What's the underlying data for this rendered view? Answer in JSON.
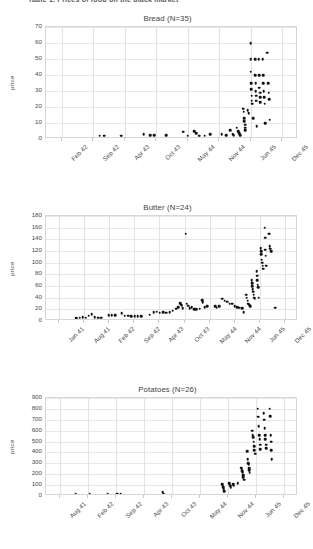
{
  "document": {
    "header_text": "Table 1. Prices of food on the black market"
  },
  "charts": [
    {
      "title": "Bread (N=35)",
      "ylabel": "price",
      "chart_index": 0
    },
    {
      "title": "Butter (N=24)",
      "ylabel": "price",
      "chart_index": 1
    },
    {
      "title": "Potatoes (N=26)",
      "ylabel": "price",
      "chart_index": 2
    }
  ],
  "chart_data": [
    {
      "type": "scatter",
      "title": "Bread (N=35)",
      "xlabel": "",
      "ylabel": "price",
      "ylim": [
        0,
        70
      ],
      "yticks": [
        0,
        10,
        20,
        30,
        40,
        50,
        60,
        70
      ],
      "xticks": [
        "Feb 42",
        "Sep 42",
        "Apr 43",
        "Oct 43",
        "May 44",
        "Nov 44",
        "Jun 45",
        "Dec 45"
      ],
      "xlim_months": [
        0,
        47
      ],
      "grid": true,
      "legend": "none",
      "note": "x positions are months measured from Nov 41 (tick 0 = Feb 42 at month 3)",
      "points": [
        {
          "x": 10.0,
          "y": 2.0
        },
        {
          "x": 10.8,
          "y": 2.0
        },
        {
          "x": 14.0,
          "y": 2.0
        },
        {
          "x": 18.2,
          "y": 3.0
        },
        {
          "x": 19.4,
          "y": 2.5
        },
        {
          "x": 20.2,
          "y": 2.5
        },
        {
          "x": 22.4,
          "y": 2.5
        },
        {
          "x": 25.6,
          "y": 4.5
        },
        {
          "x": 26.4,
          "y": 2.0
        },
        {
          "x": 27.6,
          "y": 5.0
        },
        {
          "x": 28.0,
          "y": 3.5
        },
        {
          "x": 28.6,
          "y": 2.0
        },
        {
          "x": 29.6,
          "y": 2.0
        },
        {
          "x": 30.6,
          "y": 3.0
        },
        {
          "x": 32.8,
          "y": 3.0
        },
        {
          "x": 33.6,
          "y": 2.5
        },
        {
          "x": 34.4,
          "y": 5.5
        },
        {
          "x": 34.8,
          "y": 3.0
        },
        {
          "x": 35.0,
          "y": 2.5
        },
        {
          "x": 35.6,
          "y": 7.0
        },
        {
          "x": 35.8,
          "y": 5.0
        },
        {
          "x": 36.0,
          "y": 3.5
        },
        {
          "x": 36.2,
          "y": 2.5
        },
        {
          "x": 36.8,
          "y": 19.0
        },
        {
          "x": 36.9,
          "y": 17.0
        },
        {
          "x": 37.0,
          "y": 13.0
        },
        {
          "x": 37.0,
          "y": 11.0
        },
        {
          "x": 37.1,
          "y": 9.0
        },
        {
          "x": 37.1,
          "y": 7.0
        },
        {
          "x": 37.2,
          "y": 5.5
        },
        {
          "x": 37.6,
          "y": 18.0
        },
        {
          "x": 37.8,
          "y": 16.0
        },
        {
          "x": 38.2,
          "y": 60.0
        },
        {
          "x": 38.2,
          "y": 50.0
        },
        {
          "x": 38.2,
          "y": 42.0
        },
        {
          "x": 38.3,
          "y": 35.0
        },
        {
          "x": 38.3,
          "y": 31.0
        },
        {
          "x": 38.4,
          "y": 27.0
        },
        {
          "x": 38.4,
          "y": 24.0
        },
        {
          "x": 38.5,
          "y": 22.0
        },
        {
          "x": 38.6,
          "y": 13.0
        },
        {
          "x": 39.0,
          "y": 50.0
        },
        {
          "x": 39.0,
          "y": 40.0
        },
        {
          "x": 39.1,
          "y": 35.0
        },
        {
          "x": 39.1,
          "y": 30.0
        },
        {
          "x": 39.2,
          "y": 27.0
        },
        {
          "x": 39.2,
          "y": 24.0
        },
        {
          "x": 39.3,
          "y": 8.0
        },
        {
          "x": 39.7,
          "y": 50.0
        },
        {
          "x": 39.8,
          "y": 40.0
        },
        {
          "x": 39.8,
          "y": 32.0
        },
        {
          "x": 39.9,
          "y": 29.0
        },
        {
          "x": 40.0,
          "y": 26.0
        },
        {
          "x": 40.0,
          "y": 23.0
        },
        {
          "x": 40.4,
          "y": 50.0
        },
        {
          "x": 40.5,
          "y": 40.0
        },
        {
          "x": 40.5,
          "y": 35.0
        },
        {
          "x": 40.6,
          "y": 30.0
        },
        {
          "x": 40.7,
          "y": 26.0
        },
        {
          "x": 40.8,
          "y": 22.0
        },
        {
          "x": 40.9,
          "y": 10.0
        },
        {
          "x": 41.3,
          "y": 54.0
        },
        {
          "x": 41.4,
          "y": 35.0
        },
        {
          "x": 41.5,
          "y": 29.0
        },
        {
          "x": 41.6,
          "y": 25.0
        },
        {
          "x": 41.7,
          "y": 12.0
        }
      ]
    },
    {
      "type": "scatter",
      "title": "Butter (N=24)",
      "xlabel": "",
      "ylabel": "price",
      "ylim": [
        0,
        180
      ],
      "yticks": [
        0,
        20,
        40,
        60,
        80,
        100,
        120,
        140,
        160,
        180
      ],
      "xticks": [
        "Jan 41",
        "Aug 41",
        "Feb 42",
        "Sep 42",
        "Apr 43",
        "Oct 43",
        "May 44",
        "Nov 44",
        "Jun 45",
        "Dec 45"
      ],
      "xlim_months": [
        0,
        62
      ],
      "grid": true,
      "legend": "none",
      "note": "x positions are months measured from Jan 41 at tick 0",
      "points": [
        {
          "x": 7.5,
          "y": 5.0
        },
        {
          "x": 8.3,
          "y": 6.0
        },
        {
          "x": 9.0,
          "y": 7.0
        },
        {
          "x": 9.8,
          "y": 6.0
        },
        {
          "x": 10.5,
          "y": 9.0
        },
        {
          "x": 11.2,
          "y": 12.0
        },
        {
          "x": 12.0,
          "y": 7.0
        },
        {
          "x": 12.8,
          "y": 6.0
        },
        {
          "x": 13.6,
          "y": 6.0
        },
        {
          "x": 15.4,
          "y": 10.0
        },
        {
          "x": 16.2,
          "y": 10.0
        },
        {
          "x": 17.0,
          "y": 10.0
        },
        {
          "x": 18.6,
          "y": 13.0
        },
        {
          "x": 19.4,
          "y": 9.0
        },
        {
          "x": 20.2,
          "y": 9.0
        },
        {
          "x": 21.0,
          "y": 8.5
        },
        {
          "x": 21.8,
          "y": 8.0
        },
        {
          "x": 22.6,
          "y": 8.0
        },
        {
          "x": 23.4,
          "y": 8.0
        },
        {
          "x": 25.5,
          "y": 11.0
        },
        {
          "x": 26.5,
          "y": 15.0
        },
        {
          "x": 27.2,
          "y": 16.0
        },
        {
          "x": 28.0,
          "y": 14.0
        },
        {
          "x": 28.8,
          "y": 15.0
        },
        {
          "x": 29.6,
          "y": 14.0
        },
        {
          "x": 30.4,
          "y": 15.0
        },
        {
          "x": 31.2,
          "y": 18.0
        },
        {
          "x": 32.0,
          "y": 21.0
        },
        {
          "x": 32.5,
          "y": 24.0
        },
        {
          "x": 33.0,
          "y": 31.0
        },
        {
          "x": 33.2,
          "y": 28.0
        },
        {
          "x": 33.4,
          "y": 26.0
        },
        {
          "x": 33.6,
          "y": 22.0
        },
        {
          "x": 34.4,
          "y": 150.0
        },
        {
          "x": 34.6,
          "y": 30.0
        },
        {
          "x": 35.0,
          "y": 26.0
        },
        {
          "x": 35.4,
          "y": 22.0
        },
        {
          "x": 35.8,
          "y": 24.0
        },
        {
          "x": 36.4,
          "y": 20.0
        },
        {
          "x": 37.0,
          "y": 20.0
        },
        {
          "x": 37.8,
          "y": 21.0
        },
        {
          "x": 38.4,
          "y": 36.0
        },
        {
          "x": 38.6,
          "y": 32.0
        },
        {
          "x": 39.0,
          "y": 24.0
        },
        {
          "x": 39.6,
          "y": 25.0
        },
        {
          "x": 41.6,
          "y": 25.0
        },
        {
          "x": 42.0,
          "y": 23.0
        },
        {
          "x": 42.6,
          "y": 25.0
        },
        {
          "x": 43.4,
          "y": 38.0
        },
        {
          "x": 44.0,
          "y": 35.0
        },
        {
          "x": 44.6,
          "y": 33.0
        },
        {
          "x": 45.2,
          "y": 30.0
        },
        {
          "x": 45.8,
          "y": 30.0
        },
        {
          "x": 46.4,
          "y": 25.0
        },
        {
          "x": 47.0,
          "y": 24.0
        },
        {
          "x": 47.6,
          "y": 23.0
        },
        {
          "x": 48.2,
          "y": 22.0
        },
        {
          "x": 48.6,
          "y": 15.0
        },
        {
          "x": 49.2,
          "y": 45.0
        },
        {
          "x": 49.4,
          "y": 40.0
        },
        {
          "x": 49.6,
          "y": 35.0
        },
        {
          "x": 49.8,
          "y": 30.0
        },
        {
          "x": 50.0,
          "y": 28.0
        },
        {
          "x": 50.2,
          "y": 25.0
        },
        {
          "x": 50.6,
          "y": 70.0
        },
        {
          "x": 50.7,
          "y": 65.0
        },
        {
          "x": 50.8,
          "y": 60.0
        },
        {
          "x": 50.9,
          "y": 55.0
        },
        {
          "x": 51.0,
          "y": 50.0
        },
        {
          "x": 51.1,
          "y": 45.0
        },
        {
          "x": 51.2,
          "y": 40.0
        },
        {
          "x": 51.3,
          "y": 38.0
        },
        {
          "x": 51.8,
          "y": 85.0
        },
        {
          "x": 51.9,
          "y": 78.0
        },
        {
          "x": 52.0,
          "y": 70.0
        },
        {
          "x": 52.1,
          "y": 62.0
        },
        {
          "x": 52.2,
          "y": 58.0
        },
        {
          "x": 52.3,
          "y": 40.0
        },
        {
          "x": 52.8,
          "y": 125.0
        },
        {
          "x": 52.9,
          "y": 120.0
        },
        {
          "x": 53.0,
          "y": 115.0
        },
        {
          "x": 53.1,
          "y": 105.0
        },
        {
          "x": 53.2,
          "y": 100.0
        },
        {
          "x": 53.3,
          "y": 95.0
        },
        {
          "x": 53.4,
          "y": 90.0
        },
        {
          "x": 53.8,
          "y": 160.0
        },
        {
          "x": 53.9,
          "y": 143.0
        },
        {
          "x": 54.0,
          "y": 122.0
        },
        {
          "x": 54.1,
          "y": 112.0
        },
        {
          "x": 54.2,
          "y": 95.0
        },
        {
          "x": 54.8,
          "y": 150.0
        },
        {
          "x": 54.9,
          "y": 150.0
        },
        {
          "x": 55.0,
          "y": 128.0
        },
        {
          "x": 55.2,
          "y": 124.0
        },
        {
          "x": 55.4,
          "y": 120.0
        },
        {
          "x": 56.4,
          "y": 23.0
        }
      ]
    },
    {
      "type": "scatter",
      "title": "Potatoes (N=26)",
      "xlabel": "",
      "ylabel": "price",
      "ylim": [
        0,
        900
      ],
      "yticks": [
        0,
        100,
        200,
        300,
        400,
        500,
        600,
        700,
        800,
        900
      ],
      "xticks": [
        "Aug 41",
        "Feb 42",
        "Sep 42",
        "Apr 43",
        "Oct 43",
        "May 44",
        "Nov 44",
        "Jun 45",
        "Dec 45"
      ],
      "xlim_months": [
        0,
        55
      ],
      "grid": true,
      "legend": "none",
      "note": "x positions are months measured from Aug 41 at tick 0",
      "points": [
        {
          "x": 6.5,
          "y": 20.0
        },
        {
          "x": 9.5,
          "y": 20.0
        },
        {
          "x": 13.5,
          "y": 20.0
        },
        {
          "x": 15.5,
          "y": 20.0
        },
        {
          "x": 16.3,
          "y": 20.0
        },
        {
          "x": 25.5,
          "y": 35.0
        },
        {
          "x": 25.7,
          "y": 20.0
        },
        {
          "x": 38.5,
          "y": 110.0
        },
        {
          "x": 38.6,
          "y": 95.0
        },
        {
          "x": 38.7,
          "y": 80.0
        },
        {
          "x": 38.8,
          "y": 60.0
        },
        {
          "x": 38.9,
          "y": 45.0
        },
        {
          "x": 40.0,
          "y": 120.0
        },
        {
          "x": 40.1,
          "y": 105.0
        },
        {
          "x": 40.2,
          "y": 95.0
        },
        {
          "x": 40.3,
          "y": 80.0
        },
        {
          "x": 40.9,
          "y": 110.0
        },
        {
          "x": 41.0,
          "y": 95.0
        },
        {
          "x": 41.8,
          "y": 120.0
        },
        {
          "x": 42.6,
          "y": 260.0
        },
        {
          "x": 42.7,
          "y": 245.0
        },
        {
          "x": 42.8,
          "y": 230.0
        },
        {
          "x": 42.9,
          "y": 215.0
        },
        {
          "x": 43.0,
          "y": 190.0
        },
        {
          "x": 43.1,
          "y": 170.0
        },
        {
          "x": 43.2,
          "y": 150.0
        },
        {
          "x": 43.9,
          "y": 410.0
        },
        {
          "x": 44.0,
          "y": 340.0
        },
        {
          "x": 44.1,
          "y": 300.0
        },
        {
          "x": 44.2,
          "y": 290.0
        },
        {
          "x": 44.3,
          "y": 255.0
        },
        {
          "x": 44.4,
          "y": 235.0
        },
        {
          "x": 44.5,
          "y": 215.0
        },
        {
          "x": 45.0,
          "y": 600.0
        },
        {
          "x": 45.1,
          "y": 560.0
        },
        {
          "x": 45.2,
          "y": 540.0
        },
        {
          "x": 45.3,
          "y": 500.0
        },
        {
          "x": 45.4,
          "y": 460.0
        },
        {
          "x": 45.5,
          "y": 420.0
        },
        {
          "x": 45.6,
          "y": 390.0
        },
        {
          "x": 46.2,
          "y": 800.0
        },
        {
          "x": 46.3,
          "y": 730.0
        },
        {
          "x": 46.4,
          "y": 640.0
        },
        {
          "x": 46.5,
          "y": 560.0
        },
        {
          "x": 46.6,
          "y": 520.0
        },
        {
          "x": 46.7,
          "y": 470.0
        },
        {
          "x": 46.8,
          "y": 430.0
        },
        {
          "x": 47.5,
          "y": 760.0
        },
        {
          "x": 47.6,
          "y": 700.0
        },
        {
          "x": 47.7,
          "y": 620.0
        },
        {
          "x": 47.8,
          "y": 560.0
        },
        {
          "x": 47.9,
          "y": 520.0
        },
        {
          "x": 48.0,
          "y": 470.0
        },
        {
          "x": 48.1,
          "y": 440.0
        },
        {
          "x": 48.8,
          "y": 800.0
        },
        {
          "x": 48.9,
          "y": 735.0
        },
        {
          "x": 49.0,
          "y": 560.0
        },
        {
          "x": 49.1,
          "y": 500.0
        },
        {
          "x": 49.2,
          "y": 420.0
        },
        {
          "x": 49.3,
          "y": 340.0
        }
      ]
    }
  ]
}
